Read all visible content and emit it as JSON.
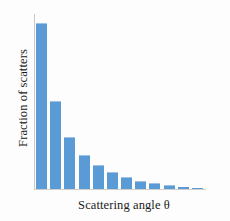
{
  "chart_data": {
    "type": "bar",
    "title": "",
    "subtitle": "",
    "xlabel": "Scattering angle θ",
    "ylabel": "Fraction of scatters",
    "categories": [
      "1",
      "2",
      "3",
      "4",
      "5",
      "6",
      "7",
      "8",
      "9",
      "10",
      "11",
      "12"
    ],
    "values": [
      100,
      53,
      31,
      20,
      14,
      10,
      6.5,
      4.5,
      3.0,
      2.0,
      1.2,
      0.6
    ],
    "ylim": [
      0,
      106
    ],
    "xticklabels": [],
    "yticklabels": [],
    "grid": false,
    "legend": null,
    "annotations": [],
    "series": [
      {
        "name": "Fraction of scatters",
        "values": [
          100,
          53,
          31,
          20,
          14,
          10,
          6.5,
          4.5,
          3.0,
          2.0,
          1.2,
          0.6
        ]
      }
    ],
    "colors": {
      "bar_fill": "#5b9bd5",
      "bar_top_edge": "#9cc3e4",
      "axis": "#c9c9c9",
      "text": "#1a1a1a",
      "background": "#fdfdfd"
    }
  },
  "axes": {
    "x_label_text": "Scattering angle θ",
    "y_label_text": "Fraction of scatters"
  }
}
